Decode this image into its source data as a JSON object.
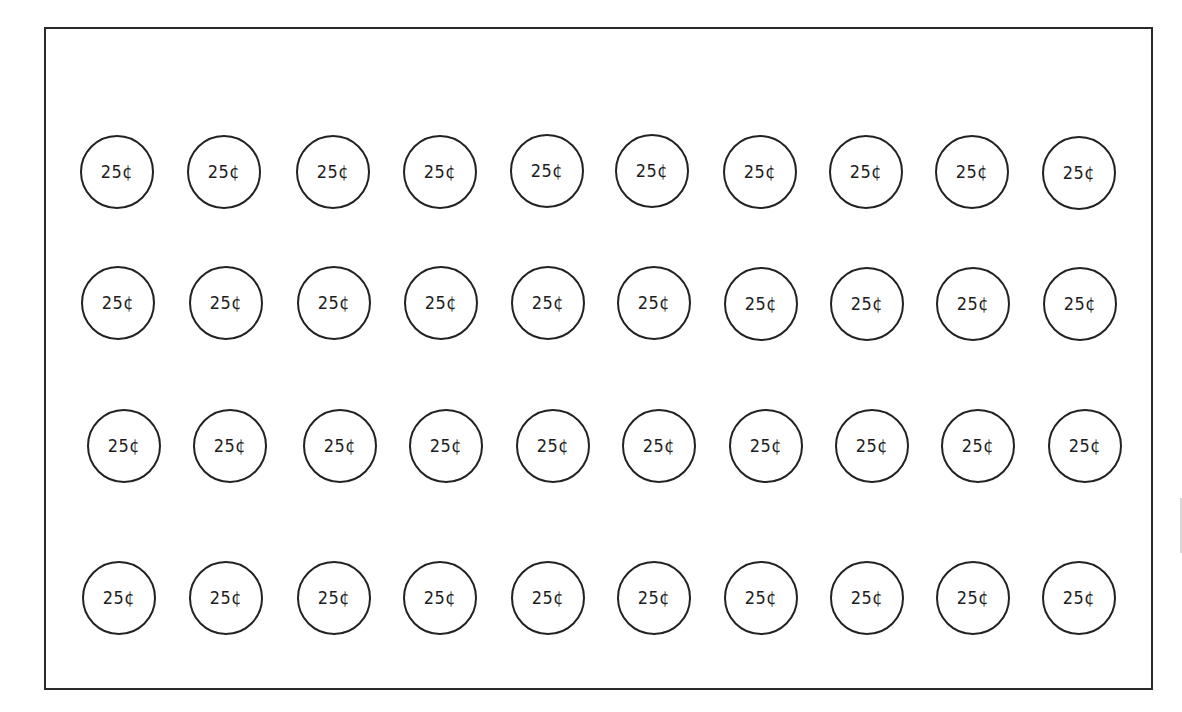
{
  "worksheet": {
    "coin_label": "25¢",
    "coin_count": 40,
    "rows": 4,
    "columns": 10,
    "colors": {
      "stroke": "#222222",
      "background": "#ffffff"
    },
    "coins": [
      [
        {
          "label": "25¢",
          "x": 117,
          "y": 172
        },
        {
          "label": "25¢",
          "x": 224,
          "y": 172
        },
        {
          "label": "25¢",
          "x": 333,
          "y": 172
        },
        {
          "label": "25¢",
          "x": 440,
          "y": 172
        },
        {
          "label": "25¢",
          "x": 547,
          "y": 171
        },
        {
          "label": "25¢",
          "x": 652,
          "y": 171
        },
        {
          "label": "25¢",
          "x": 760,
          "y": 172
        },
        {
          "label": "25¢",
          "x": 866,
          "y": 172
        },
        {
          "label": "25¢",
          "x": 972,
          "y": 172
        },
        {
          "label": "25¢",
          "x": 1079,
          "y": 173
        }
      ],
      [
        {
          "label": "25¢",
          "x": 118,
          "y": 303
        },
        {
          "label": "25¢",
          "x": 226,
          "y": 303
        },
        {
          "label": "25¢",
          "x": 334,
          "y": 303
        },
        {
          "label": "25¢",
          "x": 441,
          "y": 303
        },
        {
          "label": "25¢",
          "x": 548,
          "y": 303
        },
        {
          "label": "25¢",
          "x": 654,
          "y": 303
        },
        {
          "label": "25¢",
          "x": 761,
          "y": 304
        },
        {
          "label": "25¢",
          "x": 867,
          "y": 304
        },
        {
          "label": "25¢",
          "x": 973,
          "y": 304
        },
        {
          "label": "25¢",
          "x": 1080,
          "y": 304
        }
      ],
      [
        {
          "label": "25¢",
          "x": 124,
          "y": 446
        },
        {
          "label": "25¢",
          "x": 230,
          "y": 446
        },
        {
          "label": "25¢",
          "x": 340,
          "y": 446
        },
        {
          "label": "25¢",
          "x": 446,
          "y": 446
        },
        {
          "label": "25¢",
          "x": 553,
          "y": 446
        },
        {
          "label": "25¢",
          "x": 659,
          "y": 446
        },
        {
          "label": "25¢",
          "x": 766,
          "y": 446
        },
        {
          "label": "25¢",
          "x": 872,
          "y": 446
        },
        {
          "label": "25¢",
          "x": 978,
          "y": 446
        },
        {
          "label": "25¢",
          "x": 1085,
          "y": 446
        }
      ],
      [
        {
          "label": "25¢",
          "x": 119,
          "y": 598
        },
        {
          "label": "25¢",
          "x": 226,
          "y": 598
        },
        {
          "label": "25¢",
          "x": 334,
          "y": 598
        },
        {
          "label": "25¢",
          "x": 440,
          "y": 598
        },
        {
          "label": "25¢",
          "x": 548,
          "y": 598
        },
        {
          "label": "25¢",
          "x": 654,
          "y": 598
        },
        {
          "label": "25¢",
          "x": 761,
          "y": 598
        },
        {
          "label": "25¢",
          "x": 867,
          "y": 598
        },
        {
          "label": "25¢",
          "x": 973,
          "y": 598
        },
        {
          "label": "25¢",
          "x": 1079,
          "y": 598
        }
      ]
    ]
  }
}
